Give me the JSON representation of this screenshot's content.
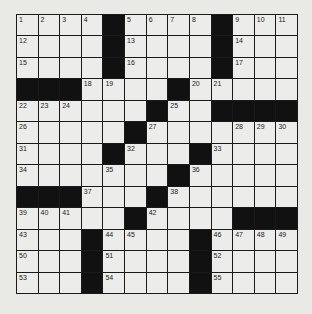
{
  "puzzle": {
    "rows": 13,
    "cols": 13,
    "colors": {
      "black": "#111111",
      "white": "#ececea",
      "background": "#e9e9e6"
    },
    "grid": [
      "....#....#...",
      "....#....#...",
      "....#....#...",
      "###....#.....",
      "......#..####",
      ".....#.......",
      "....#...#....",
      ".......#.....",
      "###...#......",
      ".....#....###",
      "...#....#....",
      "...#....#....",
      "...#....#...."
    ],
    "numbers": [
      [
        1,
        2,
        3,
        4,
        0,
        5,
        6,
        7,
        8,
        0,
        9,
        10,
        11
      ],
      [
        12,
        0,
        0,
        0,
        0,
        13,
        0,
        0,
        0,
        0,
        14,
        0,
        0
      ],
      [
        15,
        0,
        0,
        0,
        0,
        16,
        0,
        0,
        0,
        0,
        17,
        0,
        0
      ],
      [
        0,
        0,
        0,
        18,
        19,
        0,
        0,
        0,
        20,
        21,
        0,
        0,
        0
      ],
      [
        22,
        23,
        24,
        0,
        0,
        0,
        0,
        25,
        0,
        0,
        0,
        0,
        0
      ],
      [
        26,
        0,
        0,
        0,
        0,
        0,
        27,
        0,
        0,
        0,
        28,
        29,
        30
      ],
      [
        31,
        0,
        0,
        0,
        0,
        32,
        0,
        0,
        0,
        33,
        0,
        0,
        0
      ],
      [
        34,
        0,
        0,
        0,
        35,
        0,
        0,
        0,
        36,
        0,
        0,
        0,
        0
      ],
      [
        0,
        0,
        0,
        37,
        0,
        0,
        0,
        38,
        0,
        0,
        0,
        0,
        0
      ],
      [
        39,
        40,
        41,
        0,
        0,
        0,
        42,
        0,
        0,
        0,
        0,
        0,
        0
      ],
      [
        43,
        0,
        0,
        0,
        44,
        45,
        0,
        0,
        0,
        46,
        47,
        48,
        49
      ],
      [
        50,
        0,
        0,
        0,
        51,
        0,
        0,
        0,
        0,
        52,
        0,
        0,
        0
      ],
      [
        53,
        0,
        0,
        0,
        54,
        0,
        0,
        0,
        0,
        55,
        0,
        0,
        0
      ]
    ]
  }
}
